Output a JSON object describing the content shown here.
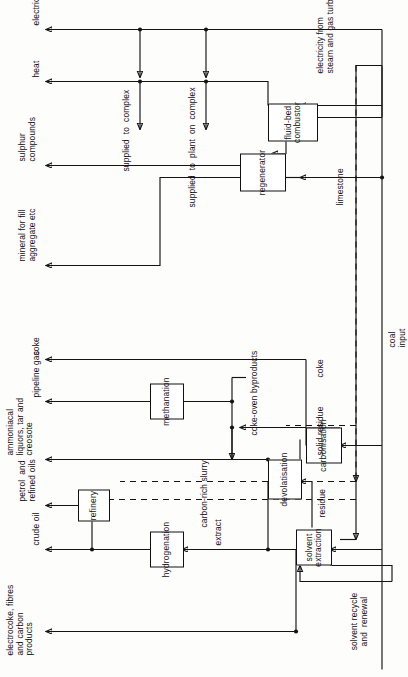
{
  "diagram": {
    "orientation": "rotated-90-ccw",
    "input": {
      "label_line1": "coal",
      "label_line2": "input"
    },
    "nodes": [
      {
        "id": "solvent_extraction",
        "label": "solvent  extraction"
      },
      {
        "id": "hydrogenation",
        "label": "hydrogenation"
      },
      {
        "id": "refinery",
        "label": "refinery"
      },
      {
        "id": "devolatisation",
        "label": "devolatisation"
      },
      {
        "id": "methanation",
        "label": "methanation"
      },
      {
        "id": "carbonisation",
        "label": "carbonisation"
      },
      {
        "id": "regenerator",
        "label": "regenerator"
      },
      {
        "id": "fluid_bed_combustor",
        "label": "fluid-bed  combustor"
      }
    ],
    "flow_labels": [
      {
        "id": "solvent_recycle",
        "text": "solvent recycle\nand  renewal"
      },
      {
        "id": "extract",
        "text": "extract"
      },
      {
        "id": "carbon_rich_slurry",
        "text": "carbon-rich slurry"
      },
      {
        "id": "residue",
        "text": "residue"
      },
      {
        "id": "solid_residue",
        "text": "solid residue"
      },
      {
        "id": "coke_oven_byprod",
        "text": "coke-oven byproducts"
      },
      {
        "id": "coke_internal",
        "text": "coke"
      },
      {
        "id": "limestone",
        "text": "limestone"
      },
      {
        "id": "electricity_from",
        "text": "electricity from\nsteam and gas turbines"
      },
      {
        "id": "supplied_plant",
        "text": "supplied  to  plant  on  complex"
      },
      {
        "id": "supplied_complex",
        "text": "supplied  to  complex"
      }
    ],
    "outputs": [
      {
        "id": "electrocoke",
        "text": "electrocoke, fibres\nand carbon\nproducts"
      },
      {
        "id": "crude_oil",
        "text": "crude oil"
      },
      {
        "id": "petrol",
        "text": "petrol  and\nrefined oils"
      },
      {
        "id": "ammoniacal",
        "text": "ammoniacal\nliquors, tar and\ncreosote"
      },
      {
        "id": "pipeline_gas",
        "text": "pipeline gas"
      },
      {
        "id": "coke",
        "text": "coke"
      },
      {
        "id": "mineral",
        "text": "mineral for fill\naggregate etc"
      },
      {
        "id": "sulphur",
        "text": "sulphur\ncompounds"
      },
      {
        "id": "heat",
        "text": "heat"
      },
      {
        "id": "electricity",
        "text": "electricity"
      }
    ],
    "colors": {
      "ink": "#141414",
      "paper": "#fdfdfc"
    }
  }
}
